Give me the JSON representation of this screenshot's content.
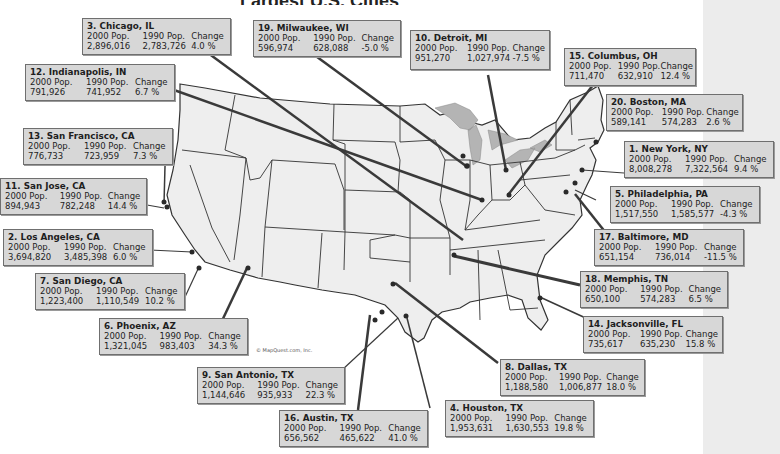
{
  "title_fragment": "Largest U.S. Cities",
  "colors": {
    "box_fill": "#d7d7d7",
    "box_border": "#6f6f6f",
    "state_fill": "#eeeeee",
    "lakes": "#b4b4b4",
    "leader": "#3a3a3a",
    "dot": "#2a2a2a",
    "background": "#ffffff",
    "right_band": "#ececec"
  },
  "labels": {
    "pop2000": "2000 Pop.",
    "pop1990": "1990 Pop.",
    "change": "Change"
  },
  "credit": "© MapQuest.com, Inc.",
  "cities": [
    {
      "rank": 1,
      "name": "1. New York, NY",
      "pop2000": "8,008,278",
      "pop1990": "7,322,564",
      "change": "9.4 %"
    },
    {
      "rank": 2,
      "name": "2. Los Angeles, CA",
      "pop2000": "3,694,820",
      "pop1990": "3,485,398",
      "change": "6.0 %"
    },
    {
      "rank": 3,
      "name": "3. Chicago, IL",
      "pop2000": "2,896,016",
      "pop1990": "2,783,726",
      "change": "4.0 %"
    },
    {
      "rank": 4,
      "name": "4. Houston, TX",
      "pop2000": "1,953,631",
      "pop1990": "1,630,553",
      "change": "19.8 %"
    },
    {
      "rank": 5,
      "name": "5. Philadelphia, PA",
      "pop2000": "1,517,550",
      "pop1990": "1,585,577",
      "change": "-4.3 %"
    },
    {
      "rank": 6,
      "name": "6. Phoenix, AZ",
      "pop2000": "1,321,045",
      "pop1990": "983,403",
      "change": "34.3 %"
    },
    {
      "rank": 7,
      "name": "7. San Diego, CA",
      "pop2000": "1,223,400",
      "pop1990": "1,110,549",
      "change": "10.2 %"
    },
    {
      "rank": 8,
      "name": "8. Dallas, TX",
      "pop2000": "1,188,580",
      "pop1990": "1,006,877",
      "change": "18.0 %"
    },
    {
      "rank": 9,
      "name": "9. San Antonio, TX",
      "pop2000": "1,144,646",
      "pop1990": "935,933",
      "change": "22.3 %"
    },
    {
      "rank": 10,
      "name": "10. Detroit, MI",
      "pop2000": "951,270",
      "pop1990": "1,027,974",
      "change": "-7.5 %"
    },
    {
      "rank": 11,
      "name": "11. San Jose, CA",
      "pop2000": "894,943",
      "pop1990": "782,248",
      "change": "14.4 %"
    },
    {
      "rank": 12,
      "name": "12. Indianapolis, IN",
      "pop2000": "791,926",
      "pop1990": "741,952",
      "change": "6.7 %"
    },
    {
      "rank": 13,
      "name": "13. San Francisco, CA",
      "pop2000": "776,733",
      "pop1990": "723,959",
      "change": "7.3 %"
    },
    {
      "rank": 14,
      "name": "14. Jacksonville, FL",
      "pop2000": "735,617",
      "pop1990": "635,230",
      "change": "15.8 %"
    },
    {
      "rank": 15,
      "name": "15. Columbus, OH",
      "pop2000": "711,470",
      "pop1990": "632,910",
      "change": "12.4 %"
    },
    {
      "rank": 16,
      "name": "16. Austin, TX",
      "pop2000": "656,562",
      "pop1990": "465,622",
      "change": "41.0 %"
    },
    {
      "rank": 17,
      "name": "17. Baltimore, MD",
      "pop2000": "651,154",
      "pop1990": "736,014",
      "change": "-11.5 %"
    },
    {
      "rank": 18,
      "name": "18. Memphis, TN",
      "pop2000": "650,100",
      "pop1990": "574,283",
      "change": "6.5 %"
    },
    {
      "rank": 19,
      "name": "19. Milwaukee, WI",
      "pop2000": "596,974",
      "pop1990": "628,088",
      "change": "-5.0 %"
    },
    {
      "rank": 20,
      "name": "20. Boston, MA",
      "pop2000": "589,141",
      "pop1990": "574,283",
      "change": "2.6 %"
    }
  ]
}
